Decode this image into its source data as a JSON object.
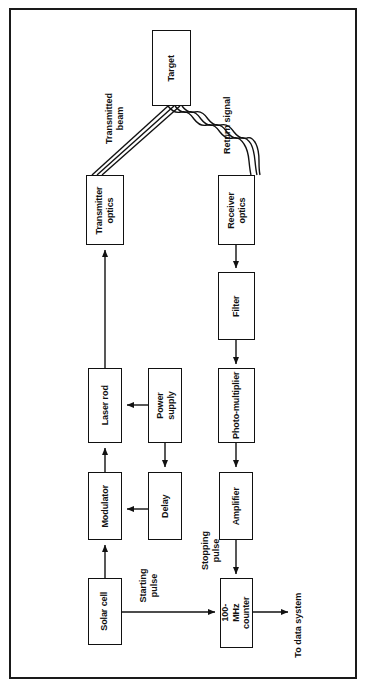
{
  "figure": {
    "type": "block-diagram",
    "border_color": "#1a1a1a",
    "line_color": "#111111",
    "background": "#ffffff"
  },
  "nodes": {
    "target": {
      "label": "Target"
    },
    "transmitter_optics": {
      "label": "Transmitter\noptics"
    },
    "receiver_optics": {
      "label": "Receiver\noptics"
    },
    "filter": {
      "label": "Filter"
    },
    "laser_rod": {
      "label": "Laser rod"
    },
    "power_supply": {
      "label": "Power\nsupply"
    },
    "photomultiplier": {
      "label": "Photo-multiplier"
    },
    "modulator": {
      "label": "Modulator"
    },
    "delay": {
      "label": "Delay"
    },
    "amplifier": {
      "label": "Amplifier"
    },
    "solar_cell": {
      "label": "Solar cell"
    },
    "counter": {
      "label": "100-MHz\ncounter"
    }
  },
  "labels": {
    "transmitted_beam": "Transmitted beam",
    "return_signal": "Return signal",
    "starting_pulse": "Starting\npulse",
    "stopping_pulse": "Stopping\npulse",
    "to_data_system": "To data system"
  },
  "connections": [
    {
      "from": "solar_cell",
      "to": "modulator",
      "direction": "up"
    },
    {
      "from": "modulator",
      "to": "laser_rod",
      "direction": "up"
    },
    {
      "from": "laser_rod",
      "to": "transmitter_optics",
      "direction": "up"
    },
    {
      "from": "transmitter_optics",
      "to": "target",
      "direction": "beam",
      "label": "Transmitted beam"
    },
    {
      "from": "target",
      "to": "receiver_optics",
      "direction": "wavy",
      "label": "Return signal"
    },
    {
      "from": "receiver_optics",
      "to": "filter",
      "direction": "down"
    },
    {
      "from": "filter",
      "to": "photomultiplier",
      "direction": "down"
    },
    {
      "from": "photomultiplier",
      "to": "amplifier",
      "direction": "down"
    },
    {
      "from": "amplifier",
      "to": "counter",
      "direction": "down",
      "label": "Stopping pulse"
    },
    {
      "from": "solar_cell",
      "to": "counter",
      "direction": "right",
      "label": "Starting pulse"
    },
    {
      "from": "power_supply",
      "to": "laser_rod",
      "direction": "left"
    },
    {
      "from": "power_supply",
      "to": "delay",
      "direction": "down"
    },
    {
      "from": "delay",
      "to": "modulator",
      "direction": "left"
    },
    {
      "from": "counter",
      "to": "data_system",
      "direction": "right",
      "label": "To data system"
    }
  ]
}
